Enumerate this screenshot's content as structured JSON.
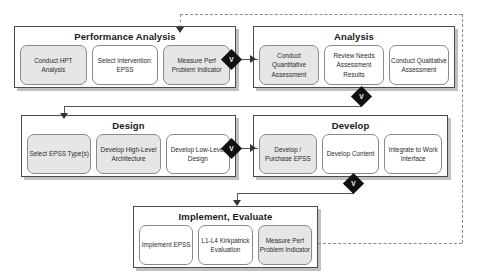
{
  "diagram": {
    "phases": [
      {
        "id": "performance-analysis",
        "title": "Performance Analysis",
        "steps": [
          {
            "label": "Conduct HPT Analysis",
            "shaded": true
          },
          {
            "label": "Select Intervention: EPSS",
            "shaded": false
          },
          {
            "label": "Measure Perf Problem Indicator",
            "shaded": true
          }
        ]
      },
      {
        "id": "analysis",
        "title": "Analysis",
        "steps": [
          {
            "label": "Conduct Quantitative Assessment",
            "shaded": true
          },
          {
            "label": "Review Needs Assessment Results",
            "shaded": false
          },
          {
            "label": "Conduct Qualitative Assessment",
            "shaded": false
          }
        ]
      },
      {
        "id": "design",
        "title": "Design",
        "steps": [
          {
            "label": "Select EPSS Type(s)",
            "shaded": true
          },
          {
            "label": "Develop High-Level Architecture",
            "shaded": true
          },
          {
            "label": "Develop Low-Level Design",
            "shaded": false
          }
        ]
      },
      {
        "id": "develop",
        "title": "Develop",
        "steps": [
          {
            "label": "Develop / Purchase EPSS",
            "shaded": true
          },
          {
            "label": "Develop Content",
            "shaded": false
          },
          {
            "label": "Integrate to Work Interface",
            "shaded": false
          }
        ]
      },
      {
        "id": "implement-evaluate",
        "title": "Implement, Evaluate",
        "steps": [
          {
            "label": "Implement EPSS",
            "shaded": false
          },
          {
            "label": "L1-L4 Kirkpatrick Evaluation",
            "shaded": false
          },
          {
            "label": "Measure Perf Problem Indicator",
            "shaded": true
          }
        ]
      }
    ],
    "connectors": [
      {
        "id": "pa-to-analysis",
        "marker": "V"
      },
      {
        "id": "analysis-to-design",
        "marker": "V"
      },
      {
        "id": "design-to-develop",
        "marker": "V"
      },
      {
        "id": "develop-to-implement",
        "marker": "V"
      }
    ],
    "feedback": {
      "label": "",
      "style": "dashed",
      "from": "implement-evaluate.measure-perf-problem-indicator",
      "to": "performance-analysis.measure-perf-problem-indicator"
    },
    "colors": {
      "box_border": "#4a4a4a",
      "step_border": "#8a8a8a",
      "step_shaded": "#e6e6e6",
      "diamond": "#111111",
      "connector": "#555555",
      "feedback": "#8a8a8a"
    }
  }
}
